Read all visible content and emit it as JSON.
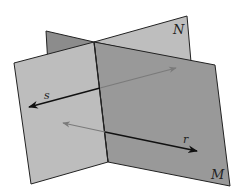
{
  "figure": {
    "planes": [
      {
        "name": "N",
        "label": "N"
      },
      {
        "name": "M",
        "label": "M"
      }
    ],
    "lines": [
      {
        "name": "s",
        "label": "s"
      },
      {
        "name": "r",
        "label": "r"
      }
    ],
    "colors": {
      "plane_n_back": "#8c8c8c",
      "plane_n_front": "#bebebe",
      "plane_left_light": "#bdbdbd",
      "plane_m_dark": "#999999",
      "edge": "#222222",
      "line_visible": "#111111",
      "line_hidden": "#7a7a7a"
    }
  }
}
